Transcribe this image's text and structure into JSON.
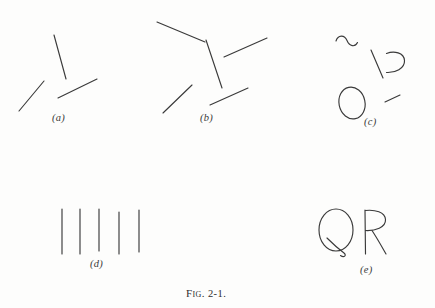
{
  "figure": {
    "caption_prefix": "Fig.",
    "caption_number": "2-1.",
    "caption_full": "Fig. 2-1.",
    "background_color": "#fdfdfc",
    "ink_color": "#3a3a3a",
    "width": 435,
    "height": 308
  },
  "panels": [
    {
      "id": "a",
      "label": "(a)",
      "label_x": 52,
      "label_y": 117,
      "description": "three separate straight line segments",
      "element_count": 3
    },
    {
      "id": "b",
      "label": "(b)",
      "label_x": 200,
      "label_y": 117,
      "description": "five straight line segments forming a Y-like junction",
      "element_count": 5
    },
    {
      "id": "c",
      "label": "(c)",
      "label_x": 364,
      "label_y": 121,
      "description": "curved squiggle, diagonal line, open C shape, ellipse, short dash",
      "element_count": 5
    },
    {
      "id": "d",
      "label": "(d)",
      "label_x": 90,
      "label_y": 262,
      "description": "five parallel vertical lines",
      "element_count": 5
    },
    {
      "id": "e",
      "label": "(e)",
      "label_x": 360,
      "label_y": 268,
      "description": "hand drawn letters Q and R",
      "element_count": 2
    }
  ],
  "panel_e_glyphs": [
    {
      "char": "Q",
      "x": 322,
      "y": 210,
      "size": 40
    },
    {
      "char": "R",
      "x": 358,
      "y": 210,
      "size": 40
    }
  ],
  "chart_data": {
    "type": "diagram",
    "panels": {
      "a": {
        "label": "(a)",
        "segments": [
          {
            "name": "upper-vertical-line",
            "x1": 54,
            "y1": 35,
            "x2": 66,
            "y2": 79
          },
          {
            "name": "lower-left-diagonal",
            "x1": 19,
            "y1": 111,
            "x2": 44,
            "y2": 81
          },
          {
            "name": "lower-right-diagonal",
            "x1": 58,
            "y1": 98,
            "x2": 97,
            "y2": 79
          }
        ]
      },
      "b": {
        "label": "(b)",
        "segments": [
          {
            "name": "upper-left-diagonal",
            "x1": 157,
            "y1": 22,
            "x2": 205,
            "y2": 42
          },
          {
            "name": "central-vertical-line",
            "x1": 206,
            "y1": 40,
            "x2": 222,
            "y2": 88
          },
          {
            "name": "upper-right-diagonal",
            "x1": 224,
            "y1": 57,
            "x2": 267,
            "y2": 38
          },
          {
            "name": "lower-left-diagonal",
            "x1": 163,
            "y1": 113,
            "x2": 192,
            "y2": 85
          },
          {
            "name": "lower-right-diagonal",
            "x1": 210,
            "y1": 105,
            "x2": 248,
            "y2": 88
          }
        ]
      },
      "c": {
        "label": "(c)",
        "shapes": [
          {
            "name": "tilde-squiggle",
            "type": "curve",
            "x": 336,
            "y": 36,
            "w": 21,
            "h": 13
          },
          {
            "name": "diagonal-line",
            "type": "line",
            "x1": 371,
            "y1": 50,
            "x2": 383,
            "y2": 78
          },
          {
            "name": "open-c-shape",
            "type": "curve",
            "x": 386,
            "y": 52,
            "w": 19,
            "h": 22
          },
          {
            "name": "ellipse-o",
            "type": "ellipse",
            "cx": 352,
            "cy": 103,
            "rx": 13,
            "ry": 16,
            "rotation": -12
          },
          {
            "name": "short-dash",
            "type": "line",
            "x1": 385,
            "y1": 102,
            "x2": 400,
            "y2": 95
          }
        ]
      },
      "d": {
        "label": "(d)",
        "segments": [
          {
            "name": "vertical-line-1",
            "x1": 62,
            "y1": 209,
            "x2": 62,
            "y2": 254
          },
          {
            "name": "vertical-line-2",
            "x1": 80,
            "y1": 209,
            "x2": 80,
            "y2": 254
          },
          {
            "name": "vertical-line-3",
            "x1": 99,
            "y1": 209,
            "x2": 99,
            "y2": 251
          },
          {
            "name": "vertical-line-4",
            "x1": 119,
            "y1": 212,
            "x2": 119,
            "y2": 254
          },
          {
            "name": "vertical-line-5",
            "x1": 139,
            "y1": 210,
            "x2": 139,
            "y2": 252
          }
        ]
      },
      "e": {
        "label": "(e)",
        "letters": [
          "Q",
          "R"
        ]
      }
    }
  }
}
